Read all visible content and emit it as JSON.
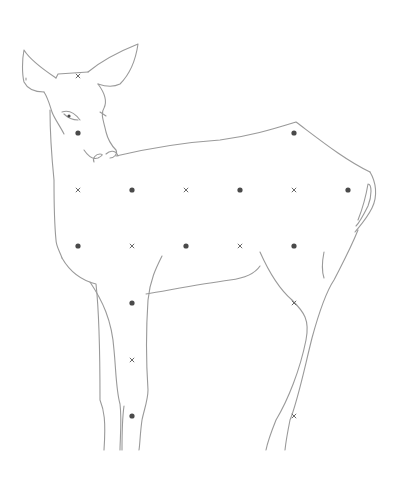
{
  "image": {
    "title": "Deer line drawing with grid markers",
    "background": "#ffffff",
    "line_color": "#9a9a9a",
    "dot_color": "#4a4a4a",
    "cross_color": "#6a6a6a"
  },
  "markers": [
    {
      "type": "cross",
      "x": 78,
      "y": 76
    },
    {
      "type": "dot",
      "x": 78,
      "y": 133
    },
    {
      "type": "dot",
      "x": 294,
      "y": 133
    },
    {
      "type": "cross",
      "x": 78,
      "y": 190
    },
    {
      "type": "dot",
      "x": 132,
      "y": 190
    },
    {
      "type": "cross",
      "x": 186,
      "y": 190
    },
    {
      "type": "dot",
      "x": 240,
      "y": 190
    },
    {
      "type": "cross",
      "x": 294,
      "y": 190
    },
    {
      "type": "dot",
      "x": 348,
      "y": 190
    },
    {
      "type": "dot",
      "x": 78,
      "y": 246
    },
    {
      "type": "cross",
      "x": 132,
      "y": 246
    },
    {
      "type": "dot",
      "x": 186,
      "y": 246
    },
    {
      "type": "cross",
      "x": 240,
      "y": 246
    },
    {
      "type": "dot",
      "x": 294,
      "y": 246
    },
    {
      "type": "dot",
      "x": 132,
      "y": 303
    },
    {
      "type": "cross",
      "x": 294,
      "y": 303
    },
    {
      "type": "cross",
      "x": 132,
      "y": 360
    },
    {
      "type": "dot",
      "x": 132,
      "y": 416
    },
    {
      "type": "cross",
      "x": 294,
      "y": 416
    }
  ],
  "caption": "Deer outline"
}
